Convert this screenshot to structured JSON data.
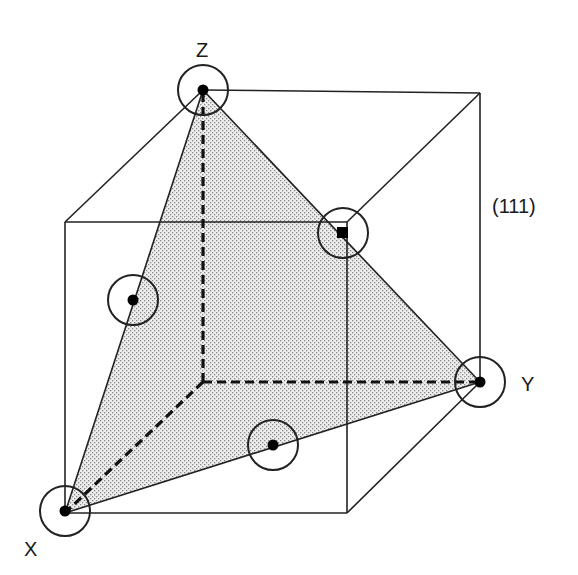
{
  "diagram": {
    "type": "crystal-plane-cube",
    "plane_label": "(111)",
    "axis_labels": {
      "x": "X",
      "y": "Y",
      "z": "Z"
    },
    "colors": {
      "stroke": "#222222",
      "plane_fill": "#d9d9d9",
      "atom": "#000000",
      "background": "#ffffff"
    },
    "vertices": {
      "origin": [
        203,
        382
      ],
      "x": [
        65,
        513
      ],
      "y": [
        480,
        382
      ],
      "z": [
        203,
        90
      ],
      "front_top_left": [
        65,
        222
      ],
      "front_top_right": [
        347,
        222
      ],
      "front_bottom_right": [
        347,
        513
      ],
      "back_top_right": [
        480,
        93
      ]
    },
    "atoms": [
      {
        "name": "atom-z",
        "cx": 203,
        "cy": 90,
        "r": 25
      },
      {
        "name": "atom-face-top",
        "cx": 343,
        "cy": 233,
        "r": 25
      },
      {
        "name": "atom-y",
        "cx": 480,
        "cy": 382,
        "r": 25
      },
      {
        "name": "atom-edge-xz",
        "cx": 133,
        "cy": 300,
        "r": 25
      },
      {
        "name": "atom-edge-xy",
        "cx": 273,
        "cy": 445,
        "r": 25
      },
      {
        "name": "atom-x",
        "cx": 65,
        "cy": 511,
        "r": 25
      }
    ]
  }
}
